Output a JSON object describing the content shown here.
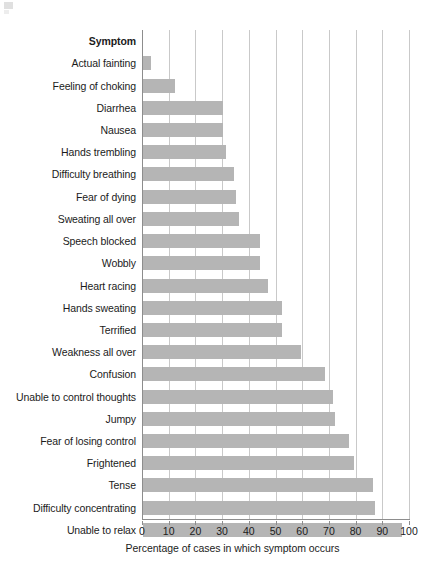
{
  "chart_data": {
    "type": "bar",
    "orientation": "horizontal",
    "title": "",
    "header_label": "Symptom",
    "xlabel": "Percentage of cases in which symptom occurs",
    "ylabel": "",
    "xlim": [
      0,
      100
    ],
    "xticks": [
      0,
      10,
      20,
      30,
      40,
      50,
      60,
      70,
      80,
      90,
      100
    ],
    "xtick_labels": [
      "0",
      "10",
      "20",
      "30",
      "40",
      "50",
      "60",
      "70",
      "80",
      "90",
      "100"
    ],
    "grid": "vertical",
    "legend": "none",
    "bar_color": "#b5b5b5",
    "axis_color": "#8d8d8d",
    "gridline_color": "#c9c9c9",
    "categories": [
      "Actual fainting",
      "Feeling of choking",
      "Diarrhea",
      "Nausea",
      "Hands trembling",
      "Difficulty breathing",
      "Fear of dying",
      "Sweating all over",
      "Speech blocked",
      "Wobbly",
      "Heart racing",
      "Hands sweating",
      "Terrified",
      "Weakness all over",
      "Confusion",
      "Unable to control thoughts",
      "Jumpy",
      "Fear of losing control",
      "Frightened",
      "Tense",
      "Difficulty concentrating",
      "Unable to relax"
    ],
    "values": [
      3,
      12,
      30,
      30,
      31,
      34,
      35,
      36,
      44,
      44,
      47,
      52,
      52,
      59,
      68,
      71,
      72,
      77,
      79,
      86,
      87,
      97
    ]
  }
}
